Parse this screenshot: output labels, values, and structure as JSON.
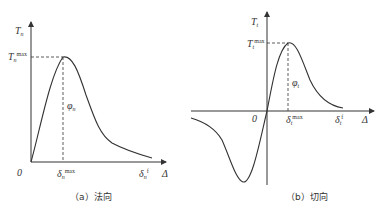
{
  "figure": {
    "panels": [
      {
        "id": "a",
        "caption": "（a）法向",
        "y_axis_label": "T",
        "y_axis_sub": "n",
        "peak_label": "T",
        "peak_sub": "n",
        "peak_sup": "max",
        "area_label": "φ",
        "area_sub": "n",
        "origin_label": "0",
        "x_peak_label": "δ",
        "x_peak_sub": "n",
        "x_peak_sup": "max",
        "x_final_label": "δ",
        "x_final_sub": "n",
        "x_final_sup": "f",
        "x_axis_label": "Δ"
      },
      {
        "id": "b",
        "caption": "（b）切向",
        "y_axis_label": "T",
        "y_axis_sub": "t",
        "peak_label": "T",
        "peak_sub": "t",
        "peak_sup": "max",
        "area_label": "φ",
        "area_sub": "t",
        "origin_label": "0",
        "x_peak_label": "δ",
        "x_peak_sub": "t",
        "x_peak_sup": "max",
        "x_final_label": "δ",
        "x_final_sub": "t",
        "x_final_sup": "f",
        "x_axis_label": "Δ"
      }
    ]
  }
}
